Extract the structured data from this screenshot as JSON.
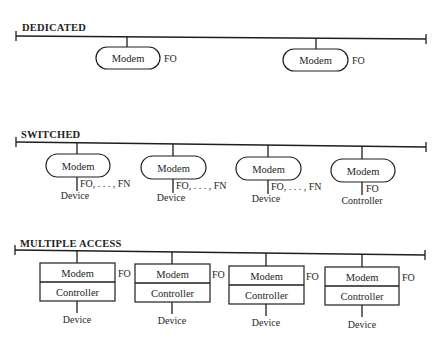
{
  "diagram": {
    "sections": [
      {
        "id": "dedicated",
        "title": "DEDICATED",
        "bus": {
          "x1": 16,
          "y1": 36,
          "x2": 426,
          "y2": 39
        },
        "title_pos": {
          "x": 22,
          "y": 31
        },
        "nodes": [
          {
            "shape": "pill",
            "x": 96,
            "y": 47,
            "w": 64,
            "h": 22,
            "label": "Modem",
            "drop_x": 127,
            "side_label": "FO",
            "side_x": 164,
            "side_y": 62
          },
          {
            "shape": "pill",
            "x": 283,
            "y": 49,
            "w": 65,
            "h": 22,
            "label": "Modem",
            "drop_x": 316,
            "side_label": "FO",
            "side_x": 352,
            "side_y": 64
          }
        ]
      },
      {
        "id": "switched",
        "title": "SWITCHED",
        "bus": {
          "x1": 16,
          "y1": 142,
          "x2": 426,
          "y2": 147
        },
        "title_pos": {
          "x": 21,
          "y": 138
        },
        "nodes": [
          {
            "shape": "pill",
            "x": 46,
            "y": 154,
            "w": 64,
            "h": 23,
            "label": "Modem",
            "drop_x": 77,
            "tail_to": 191,
            "tail_label": "FO, . . . , FN",
            "tail_label_x": 80,
            "tail_label_y": 187,
            "below_label": "Device",
            "below_x": 75,
            "below_y": 199
          },
          {
            "shape": "pill",
            "x": 141,
            "y": 156,
            "w": 65,
            "h": 23,
            "label": "Modem",
            "drop_x": 173,
            "tail_to": 193,
            "tail_label": "FO, . . . , FN",
            "tail_label_x": 176,
            "tail_label_y": 189,
            "below_label": "Device",
            "below_x": 171,
            "below_y": 201
          },
          {
            "shape": "pill",
            "x": 236,
            "y": 157,
            "w": 65,
            "h": 23,
            "label": "Modem",
            "drop_x": 268,
            "tail_to": 194,
            "tail_label": "FO, . . . , FN",
            "tail_label_x": 271,
            "tail_label_y": 190,
            "below_label": "Device",
            "below_x": 266,
            "below_y": 202
          },
          {
            "shape": "pill",
            "x": 331,
            "y": 159,
            "w": 64,
            "h": 23,
            "label": "Modem",
            "drop_x": 362,
            "tail_to": 195,
            "tail_label": "FO",
            "tail_label_x": 366,
            "tail_label_y": 192,
            "below_label": "Controller",
            "below_x": 362,
            "below_y": 204
          }
        ]
      },
      {
        "id": "multiple-access",
        "title": "MULTIPLE ACCESS",
        "bus": {
          "x1": 15,
          "y1": 250,
          "x2": 425,
          "y2": 255
        },
        "title_pos": {
          "x": 20,
          "y": 247
        },
        "nodes": [
          {
            "shape": "box",
            "x": 40,
            "y": 263,
            "w": 75,
            "h": 38,
            "label": "Modem",
            "label2": "Controller",
            "drop_x": 77,
            "side_label": "FO",
            "side_x": 118,
            "side_y": 277,
            "tail_to": 313,
            "below_label": "Device",
            "below_x": 77,
            "below_y": 323
          },
          {
            "shape": "box",
            "x": 135,
            "y": 264,
            "w": 75,
            "h": 38,
            "label": "Modem",
            "label2": "Controller",
            "drop_x": 172,
            "side_label": "FO",
            "side_x": 212,
            "side_y": 278,
            "tail_to": 314,
            "below_label": "Device",
            "below_x": 172,
            "below_y": 324
          },
          {
            "shape": "box",
            "x": 229,
            "y": 266,
            "w": 75,
            "h": 38,
            "label": "Modem",
            "label2": "Controller",
            "drop_x": 266,
            "side_label": "FO",
            "side_x": 306,
            "side_y": 280,
            "tail_to": 316,
            "below_label": "Device",
            "below_x": 266,
            "below_y": 326
          },
          {
            "shape": "box",
            "x": 325,
            "y": 267,
            "w": 74,
            "h": 38,
            "label": "Modem",
            "label2": "Controller",
            "drop_x": 362,
            "side_label": "FO",
            "side_x": 402,
            "side_y": 281,
            "tail_to": 317,
            "below_label": "Device",
            "below_x": 362,
            "below_y": 328
          }
        ]
      }
    ]
  }
}
